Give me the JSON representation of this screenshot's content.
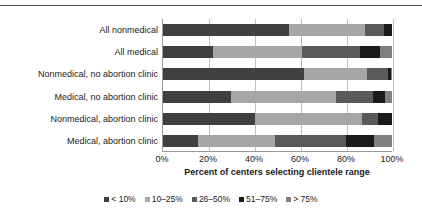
{
  "chart_data": {
    "type": "bar",
    "orientation": "horizontal",
    "stacked": true,
    "normalized_percent": true,
    "title": "",
    "xlabel": "Percent of centers selecting clientele range",
    "ylabel": "",
    "xlim": [
      0,
      100
    ],
    "xticks": [
      "0%",
      "20%",
      "40%",
      "60%",
      "80%",
      "100%"
    ],
    "xtick_values": [
      0,
      20,
      40,
      60,
      80,
      100
    ],
    "grid": "vertical",
    "legend_position": "bottom",
    "categories": [
      "All nonmedical",
      "All medical",
      "Nonmedical, no abortion clinic",
      "Medical, no abortion clinic",
      "Nonmedical, abortion clinic",
      "Medical, abortion clinic"
    ],
    "series": [
      {
        "name": "< 10%",
        "color": "#404040",
        "values": [
          54.8,
          21.7,
          61.7,
          29.6,
          40.0,
          15.2
        ]
      },
      {
        "name": "10–25%",
        "color": "#a6a6a6",
        "values": [
          33.5,
          39.1,
          27.4,
          46.1,
          47.0,
          33.9
        ]
      },
      {
        "name": "26–50%",
        "color": "#595959",
        "values": [
          8.3,
          25.2,
          9.1,
          16.1,
          7.0,
          30.9
        ]
      },
      {
        "name": "51–75%",
        "color": "#1a1a1a",
        "values": [
          3.4,
          8.7,
          1.3,
          5.2,
          6.0,
          12.2
        ]
      },
      {
        "name": "> 75%",
        "color": "#808080",
        "values": [
          0.0,
          5.3,
          0.5,
          3.0,
          0.0,
          7.8
        ]
      }
    ]
  },
  "axis": {
    "xlabel": "Percent of centers selecting clientele range"
  },
  "colors": {
    "gridline": "#bfbfbf",
    "axis": "#9a9a9a",
    "top_rule": "#4d4d4d",
    "text": "#1a1a1a",
    "background": "#ffffff"
  }
}
